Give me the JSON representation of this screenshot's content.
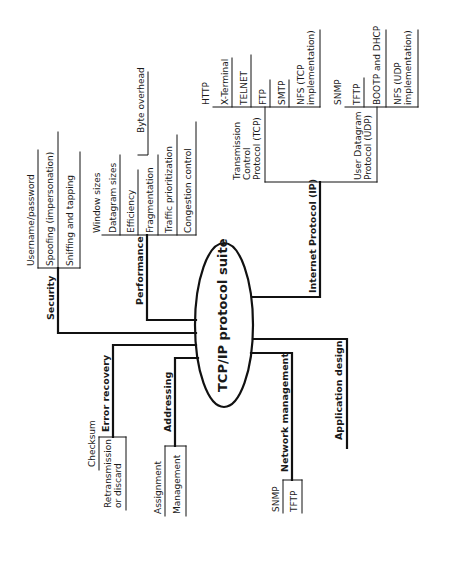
{
  "diagram": {
    "center": "TCP/IP protocol suite",
    "branches": {
      "security": {
        "label": "Security",
        "items": [
          "Username/password",
          "Spoofing (impersonation)",
          "Sniffing and tapping"
        ]
      },
      "performance": {
        "label": "Performance",
        "items": [
          "Window sizes",
          "Datagram sizes",
          "Efficiency",
          "Fragmentation",
          "Traffic prioritization",
          "Congestion control"
        ],
        "efficiency_sub": "Byte overhead"
      },
      "ip": {
        "label": "Internet Protocol (IP)",
        "tcp": {
          "label": "Transmission\nControl\nProtocol (TCP)",
          "items": [
            "HTTP",
            "X-Terminal",
            "TELNET",
            "FTP",
            "SMTP",
            "NFS (TCP\nimplementation)"
          ]
        },
        "udp": {
          "label": "User Datagram\nProtocol (UDP)",
          "items": [
            "SNMP",
            "TFTP",
            "BOOTP and DHCP",
            "NFS (UDP\nimplementation)"
          ]
        }
      },
      "error_recovery": {
        "label": "Error recovery",
        "items": [
          "Checksum",
          "Retransmission\nor discard"
        ]
      },
      "addressing": {
        "label": "Addressing",
        "items": [
          "Assignment",
          "Management"
        ]
      },
      "network_management": {
        "label": "Network management",
        "items": [
          "SNMP",
          "TFTP"
        ]
      },
      "application_design": {
        "label": "Application design"
      }
    }
  }
}
